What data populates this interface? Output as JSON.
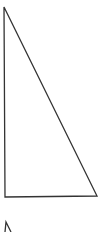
{
  "diagram": {
    "type": "right-triangle",
    "stroke_color": "#333333",
    "background": "#ffffff",
    "triangle": {
      "vertices": [
        [
          4,
          7
        ],
        [
          5,
          197
        ],
        [
          97,
          196
        ]
      ]
    },
    "partial_glyph": {
      "description": "cut-off shape at bottom edge",
      "points": [
        [
          5,
          232
        ],
        [
          6,
          222
        ],
        [
          11,
          232
        ]
      ]
    }
  }
}
